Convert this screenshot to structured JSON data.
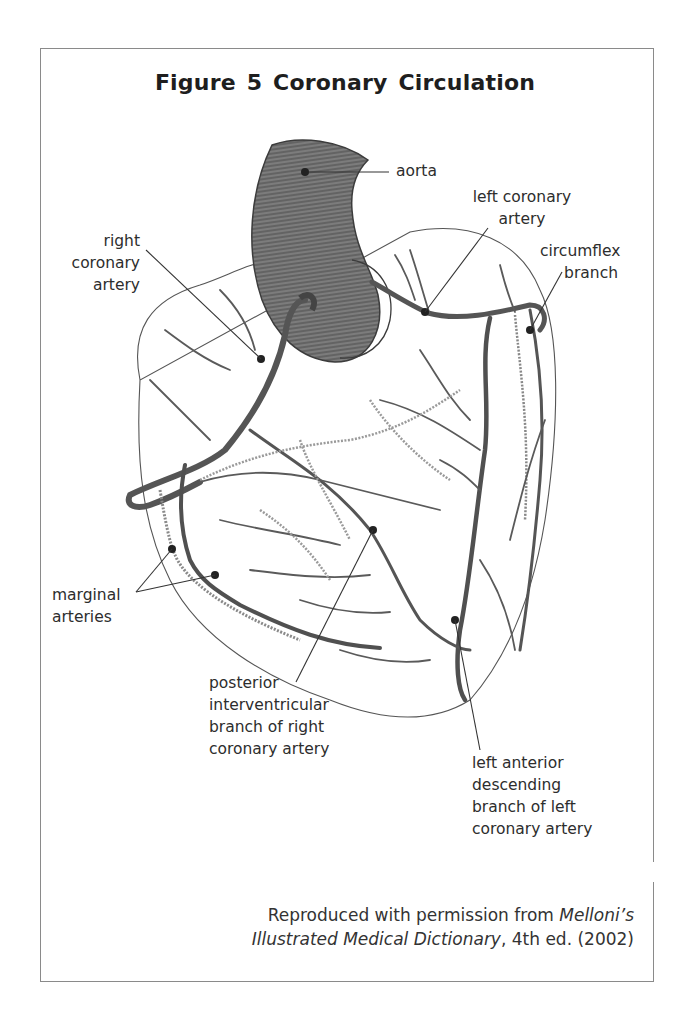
{
  "figure": {
    "title": "Figure 5  Coronary Circulation",
    "labels": {
      "aorta": "aorta",
      "left_coronary_artery": [
        "left coronary",
        "artery"
      ],
      "right_coronary_artery": [
        "right",
        "coronary",
        "artery"
      ],
      "circumflex_branch": [
        "circumflex",
        "branch"
      ],
      "marginal_arteries": [
        "marginal",
        "arteries"
      ],
      "posterior_interventricular": [
        "posterior",
        "interventricular",
        "branch of right",
        "coronary artery"
      ],
      "left_anterior_descending": [
        "left anterior",
        "descending",
        "branch of left",
        "coronary artery"
      ]
    },
    "credit": {
      "prefix": "Reproduced with permission from ",
      "title_part1": "Melloni’s",
      "title_part2": "Illustrated Medical Dictionary",
      "suffix": ", 4th ed. (2002)"
    },
    "colors": {
      "vessel": "#5a5a5a",
      "aorta_fill": "#7a7a7a",
      "outline": "#444444",
      "frame": "#8a8a8a"
    }
  }
}
